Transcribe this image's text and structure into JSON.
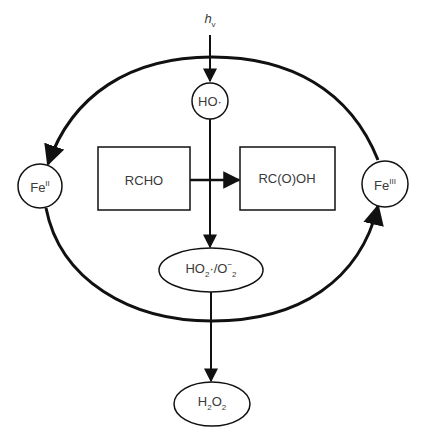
{
  "diagram": {
    "type": "reaction-cycle",
    "input": {
      "label": "h",
      "subscript": "v"
    },
    "nodes": {
      "hydroxyl": {
        "main": "HO",
        "suffix": "·"
      },
      "fe2": {
        "main": "Fe",
        "sup": "II"
      },
      "fe3": {
        "main": "Fe",
        "sup": "III"
      },
      "aldehyde": {
        "label": "RCHO"
      },
      "acid": {
        "label": "RC(O)OH"
      },
      "superoxide": {
        "p1": "HO",
        "s1": "2",
        "p2": "·/O",
        "sup2": "−",
        "s2": "2"
      },
      "peroxide": {
        "p1": "H",
        "s1": "2",
        "p2": "O",
        "s2": "2"
      }
    },
    "edges": [
      {
        "from": "hv",
        "to": "hydroxyl"
      },
      {
        "from": "hydroxyl",
        "to": "superoxide"
      },
      {
        "from": "aldehyde",
        "to": "acid"
      },
      {
        "from": "superoxide",
        "to": "peroxide"
      },
      {
        "from": "fe3",
        "to": "fe2",
        "via": "top-arc"
      },
      {
        "from": "fe2",
        "to": "fe3",
        "via": "bottom-arc"
      }
    ],
    "colors": {
      "stroke": "#111111",
      "text": "#3a3a3a",
      "background": "#ffffff"
    }
  }
}
